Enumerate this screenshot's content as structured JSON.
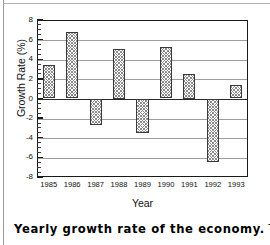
{
  "figure": {
    "yaxis_title": "Growth Rate (%)",
    "xaxis_title": "Year"
  },
  "caption": {
    "bold": "Yearly growth rate of the economy.",
    "rest": " This"
  },
  "chart_data": {
    "type": "bar",
    "title": "",
    "xlabel": "Year",
    "ylabel": "Growth Rate (%)",
    "categories": [
      "1985",
      "1986",
      "1987",
      "1988",
      "1989",
      "1990",
      "1991",
      "1992",
      "1993"
    ],
    "values": [
      3.4,
      6.8,
      -2.7,
      5.0,
      -3.55,
      5.2,
      2.5,
      -6.5,
      1.4
    ],
    "ylim": [
      -8,
      8
    ],
    "ytick_labels": [
      "8",
      "6",
      "4",
      "2",
      "0",
      "-2",
      "-4",
      "-6",
      "-8"
    ],
    "ytick_values": [
      8,
      6,
      4,
      2,
      0,
      -2,
      -4,
      -6,
      -8
    ],
    "yminor_step": 0.5,
    "grid": true,
    "grid_axis": "y",
    "legend": "none",
    "bar_fill": "crosshatch-gray",
    "bar_edge_color": "#3a3a3a",
    "grid_color": "#9d9d9d",
    "axis_color": "#1a1a1a"
  }
}
